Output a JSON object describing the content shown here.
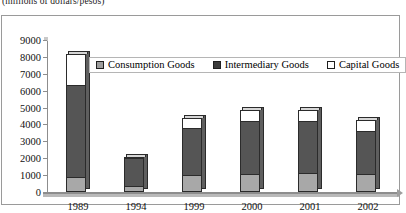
{
  "caption": "(millions of dollars/pesos)",
  "chart_data": {
    "type": "bar",
    "subtype": "stacked-column",
    "title": "",
    "subtitle": "",
    "xlabel": "",
    "ylabel": "",
    "ylim": [
      0,
      9000
    ],
    "ytick_step": 1000,
    "yticks": [
      0,
      1000,
      2000,
      3000,
      4000,
      5000,
      6000,
      7000,
      8000,
      9000
    ],
    "ytick_labels": [
      "0",
      "1000",
      "2000",
      "3000",
      "4000",
      "5000",
      "6000",
      "7000",
      "8000",
      "9000"
    ],
    "grid": false,
    "legend_position": "top-center-inside",
    "categories": [
      "1989",
      "1994",
      "1999",
      "2000",
      "2001",
      "2002"
    ],
    "series": [
      {
        "name": "Consumption Goods",
        "color": "#a8a8a8",
        "values": [
          900,
          350,
          1000,
          1050,
          1100,
          1080
        ]
      },
      {
        "name": "Intermediary Goods",
        "color": "#555555",
        "values": [
          5450,
          1650,
          2800,
          3150,
          3080,
          2540
        ]
      },
      {
        "name": "Capital Goods",
        "color": "#ffffff",
        "values": [
          1850,
          100,
          600,
          650,
          670,
          630
        ]
      }
    ],
    "totals": [
      8200,
      2100,
      4400,
      4850,
      4850,
      4250
    ],
    "annotations": []
  },
  "legend": {
    "items": [
      {
        "label": "Consumption Goods",
        "swatch": "square-filled-gray"
      },
      {
        "label": "Intermediary Goods",
        "swatch": "square-filled-dark"
      },
      {
        "label": "Capital Goods",
        "swatch": "square-outline-white"
      }
    ]
  }
}
